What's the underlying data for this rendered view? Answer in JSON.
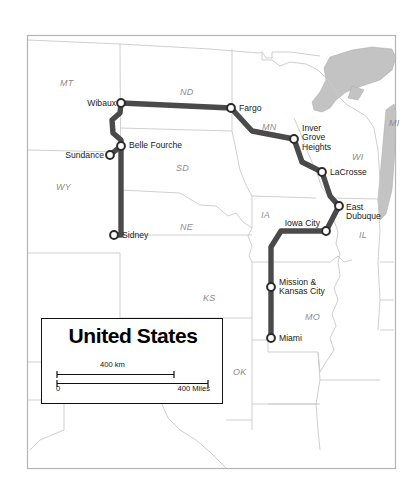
{
  "map": {
    "title": "United States",
    "background_color": "#ffffff",
    "border_color": "#b4b4b4",
    "state_line_color": "#c9c9c9",
    "water_color": "#c0c0c0",
    "route_color": "#4a4a4a",
    "node_fill": "#ffffff",
    "node_stroke": "#2b2b2b",
    "state_labels": [
      {
        "id": "MT",
        "text": "MT",
        "x": 60,
        "y": 78
      },
      {
        "id": "ND",
        "text": "ND",
        "x": 180,
        "y": 87
      },
      {
        "id": "MN",
        "text": "MN",
        "x": 262,
        "y": 122
      },
      {
        "id": "SD",
        "text": "SD",
        "x": 176,
        "y": 163
      },
      {
        "id": "WY",
        "text": "WY",
        "x": 56,
        "y": 182
      },
      {
        "id": "NE",
        "text": "NE",
        "x": 180,
        "y": 222
      },
      {
        "id": "IA",
        "text": "IA",
        "x": 261,
        "y": 210
      },
      {
        "id": "WI",
        "text": "WI",
        "x": 352,
        "y": 152
      },
      {
        "id": "IL",
        "text": "IL",
        "x": 359,
        "y": 230
      },
      {
        "id": "MI",
        "text": "MI",
        "x": 389,
        "y": 118
      },
      {
        "id": "MO",
        "text": "MO",
        "x": 305,
        "y": 312
      },
      {
        "id": "KS",
        "text": "KS",
        "x": 203,
        "y": 293
      },
      {
        "id": "OK",
        "text": "OK",
        "x": 233,
        "y": 367
      }
    ],
    "route_nodes": [
      {
        "id": "wibaux",
        "label": "Wibaux",
        "x": 121,
        "y": 103,
        "label_x": 116,
        "label_y": 99,
        "align": "right",
        "lines": [
          "Wibaux"
        ]
      },
      {
        "id": "fargo",
        "label": "Fargo",
        "x": 231,
        "y": 108,
        "label_x": 239,
        "label_y": 104,
        "align": "left",
        "lines": [
          "Fargo"
        ]
      },
      {
        "id": "inver-grove-heights",
        "label": "Inver Grove Heights",
        "x": 294,
        "y": 139,
        "label_x": 302,
        "label_y": 124,
        "align": "left",
        "lines": [
          "Inver",
          "Grove",
          "Heights"
        ]
      },
      {
        "id": "lacrosse",
        "label": "LaCrosse",
        "x": 322,
        "y": 172,
        "label_x": 330,
        "label_y": 168,
        "align": "left",
        "lines": [
          "LaCrosse"
        ]
      },
      {
        "id": "east-dubuque",
        "label": "East Dubuque",
        "x": 339,
        "y": 206,
        "label_x": 346,
        "label_y": 203,
        "align": "left",
        "lines": [
          "East",
          "Dubuque"
        ]
      },
      {
        "id": "iowa-city",
        "label": "Iowa City",
        "x": 326,
        "y": 231,
        "label_x": 320,
        "label_y": 219,
        "align": "right",
        "lines": [
          "Iowa City"
        ]
      },
      {
        "id": "mission-kansas-city",
        "label": "Mission & Kansas City",
        "x": 271,
        "y": 287,
        "label_x": 279,
        "label_y": 278,
        "align": "left",
        "lines": [
          "Mission &",
          "Kansas City"
        ]
      },
      {
        "id": "miami",
        "label": "Miami",
        "x": 271,
        "y": 338,
        "label_x": 279,
        "label_y": 334,
        "align": "left",
        "lines": [
          "Miami"
        ]
      },
      {
        "id": "belle-fourche",
        "label": "Belle Fourche",
        "x": 121,
        "y": 146,
        "label_x": 129,
        "label_y": 141,
        "align": "left",
        "lines": [
          "Belle Fourche"
        ]
      },
      {
        "id": "sundance",
        "label": "Sundance",
        "x": 110,
        "y": 155,
        "label_x": 104,
        "label_y": 151,
        "align": "right",
        "lines": [
          "Sundance"
        ]
      },
      {
        "id": "sidney",
        "label": "Sidney",
        "x": 114,
        "y": 235,
        "label_x": 122,
        "label_y": 231,
        "align": "left",
        "lines": [
          "Sidney"
        ]
      }
    ],
    "route_segments": [
      {
        "id": "wibaux-fargo",
        "points": "121,103 231,108"
      },
      {
        "id": "fargo-inver",
        "points": "231,108 252,131 294,139"
      },
      {
        "id": "inver-lacrosse",
        "points": "294,139 302,162 322,172"
      },
      {
        "id": "lacrosse-east-dubuque",
        "points": "322,172 330,196 339,206"
      },
      {
        "id": "east-dubuque-iowa-city",
        "points": "339,206 326,231"
      },
      {
        "id": "iowa-city-mission",
        "points": "326,231 281,231 271,247 271,287"
      },
      {
        "id": "mission-miami",
        "points": "271,287 271,338"
      },
      {
        "id": "wibaux-belle-fourche",
        "points": "121,103 120,113 112,120 113,133 121,140 121,146"
      },
      {
        "id": "belle-fourche-sundance",
        "points": "121,146 110,155"
      },
      {
        "id": "belle-fourche-sidney",
        "points": "121,146 121,235 114,235"
      }
    ]
  },
  "legend": {
    "title": "United States",
    "scale_km": "400 km",
    "scale_zero": "0",
    "scale_miles": "400 Miles"
  }
}
